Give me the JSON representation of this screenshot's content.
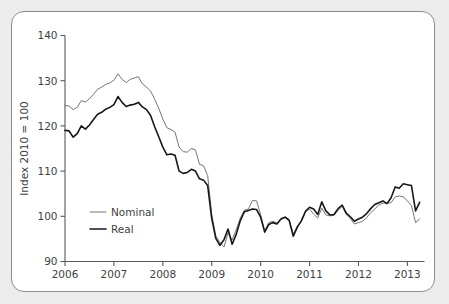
{
  "card": {
    "background": "#ffffff",
    "page_background": "#ececed",
    "border_color": "#8d8d8d"
  },
  "chart_data": {
    "type": "line",
    "title": "",
    "subtitle": "",
    "xlabel": "",
    "ylabel": "Index 2010 = 100",
    "ylim": [
      90,
      140
    ],
    "yticks": [
      90,
      100,
      110,
      120,
      130,
      140
    ],
    "ytick_labels": [
      "90",
      "100",
      "110",
      "120",
      "130",
      "140"
    ],
    "xlim": [
      2006.0,
      2013.35
    ],
    "xticks": [
      2006,
      2007,
      2008,
      2009,
      2010,
      2011,
      2012,
      2013
    ],
    "xtick_labels": [
      "2006",
      "2007",
      "2008",
      "2009",
      "2010",
      "2011",
      "2012",
      "2013"
    ],
    "grid": false,
    "legend_position": "inner-lower-left",
    "legend": [
      {
        "name": "Nominal",
        "color": "#6e6e70",
        "width": 0.95
      },
      {
        "name": "Real",
        "color": "#17171a",
        "width": 1.6
      }
    ],
    "x": [
      2006.0,
      2006.083,
      2006.167,
      2006.25,
      2006.333,
      2006.417,
      2006.5,
      2006.583,
      2006.667,
      2006.75,
      2006.833,
      2006.917,
      2007.0,
      2007.083,
      2007.167,
      2007.25,
      2007.333,
      2007.417,
      2007.5,
      2007.583,
      2007.667,
      2007.75,
      2007.833,
      2007.917,
      2008.0,
      2008.083,
      2008.167,
      2008.25,
      2008.333,
      2008.417,
      2008.5,
      2008.583,
      2008.667,
      2008.75,
      2008.833,
      2008.917,
      2009.0,
      2009.083,
      2009.167,
      2009.25,
      2009.333,
      2009.417,
      2009.5,
      2009.583,
      2009.667,
      2009.75,
      2009.833,
      2009.917,
      2010.0,
      2010.083,
      2010.167,
      2010.25,
      2010.333,
      2010.417,
      2010.5,
      2010.583,
      2010.667,
      2010.75,
      2010.833,
      2010.917,
      2011.0,
      2011.083,
      2011.167,
      2011.25,
      2011.333,
      2011.417,
      2011.5,
      2011.583,
      2011.667,
      2011.75,
      2011.833,
      2011.917,
      2012.0,
      2012.083,
      2012.167,
      2012.25,
      2012.333,
      2012.417,
      2012.5,
      2012.583,
      2012.667,
      2012.75,
      2012.833,
      2012.917,
      2013.0,
      2013.083,
      2013.167,
      2013.25
    ],
    "series": [
      {
        "name": "Nominal",
        "color": "#6e6e70",
        "values": [
          124.5,
          124.4,
          123.6,
          124.1,
          125.6,
          125.3,
          126.0,
          127.0,
          128.1,
          128.6,
          129.2,
          129.5,
          130.1,
          131.5,
          130.3,
          129.6,
          130.3,
          130.6,
          130.9,
          129.3,
          128.6,
          127.7,
          125.9,
          123.9,
          121.5,
          119.6,
          119.2,
          118.6,
          115.3,
          114.3,
          114.2,
          115.0,
          114.7,
          111.5,
          111.2,
          109.0,
          100.5,
          95.7,
          94.2,
          93.2,
          96.3,
          94.8,
          97.0,
          99.6,
          101.4,
          101.6,
          103.5,
          103.4,
          100.3,
          96.8,
          98.6,
          98.9,
          98.5,
          99.5,
          99.9,
          99.3,
          96.0,
          97.8,
          99.1,
          101.1,
          101.6,
          100.5,
          99.6,
          101.8,
          100.3,
          100.1,
          100.2,
          101.3,
          102.2,
          100.4,
          99.5,
          98.3,
          98.6,
          98.9,
          99.7,
          100.8,
          101.6,
          102.5,
          102.9,
          102.9,
          103.0,
          104.3,
          104.5,
          104.3,
          103.4,
          102.4,
          98.6,
          99.4
        ]
      },
      {
        "name": "Real",
        "color": "#17171a",
        "values": [
          119.0,
          118.9,
          117.5,
          118.3,
          120.0,
          119.3,
          120.2,
          121.4,
          122.6,
          123.0,
          123.7,
          124.1,
          124.7,
          126.5,
          125.2,
          124.3,
          124.6,
          124.8,
          125.2,
          124.2,
          123.6,
          122.3,
          119.8,
          117.6,
          115.3,
          113.6,
          113.8,
          113.5,
          110.0,
          109.5,
          109.7,
          110.4,
          110.0,
          108.3,
          108.0,
          106.8,
          99.5,
          95.1,
          93.6,
          94.8,
          97.2,
          93.8,
          96.0,
          99.0,
          101.0,
          101.3,
          101.6,
          101.5,
          99.8,
          96.5,
          98.2,
          98.6,
          98.3,
          99.4,
          99.8,
          99.1,
          95.6,
          97.6,
          99.0,
          101.1,
          102.0,
          101.6,
          100.4,
          103.2,
          101.2,
          100.3,
          100.4,
          101.7,
          102.5,
          100.7,
          99.9,
          98.9,
          99.4,
          99.8,
          100.6,
          101.7,
          102.6,
          103.0,
          103.4,
          102.8,
          104.1,
          106.5,
          106.2,
          107.2,
          107.0,
          106.8,
          101.2,
          103.1
        ]
      }
    ]
  }
}
